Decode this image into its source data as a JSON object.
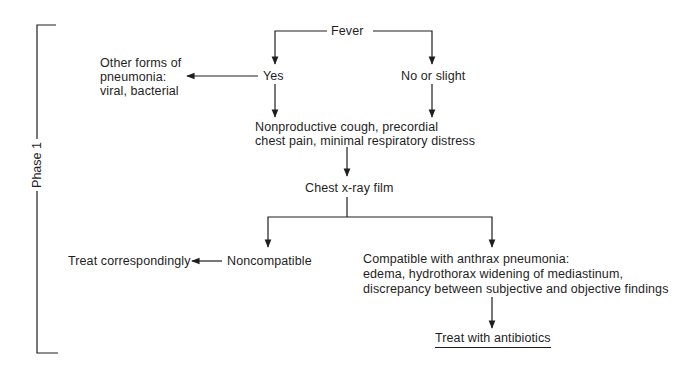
{
  "diagram": {
    "type": "flowchart",
    "phase_label": "Phase 1",
    "nodes": {
      "fever": "Fever",
      "yes": "Yes",
      "no_or_slight": "No or slight",
      "other_forms": [
        "Other forms of",
        "pneumonia:",
        "viral, bacterial"
      ],
      "symptoms": [
        "Nonproductive cough, precordial",
        "chest pain, minimal respiratory distress"
      ],
      "chest_xray": "Chest x-ray film",
      "noncompatible": "Noncompatible",
      "treat_correspondingly": "Treat correspondingly",
      "compatible": [
        "Compatible with anthrax pneumonia:",
        "edema, hydrothorax widening of mediastinum,",
        "discrepancy between subjective and objective findings"
      ],
      "treat_antibiotics": "Treat with antibiotics"
    },
    "edges": [
      {
        "from": "fever",
        "to": "yes"
      },
      {
        "from": "fever",
        "to": "no_or_slight"
      },
      {
        "from": "yes",
        "to": "other_forms"
      },
      {
        "from": "yes",
        "to": "symptoms"
      },
      {
        "from": "no_or_slight",
        "to": "symptoms"
      },
      {
        "from": "symptoms",
        "to": "chest_xray"
      },
      {
        "from": "chest_xray",
        "to": "noncompatible"
      },
      {
        "from": "chest_xray",
        "to": "compatible"
      },
      {
        "from": "noncompatible",
        "to": "treat_correspondingly"
      },
      {
        "from": "compatible",
        "to": "treat_antibiotics"
      }
    ],
    "colors": {
      "line": "#1e1e1e",
      "background": "#ffffff"
    }
  }
}
